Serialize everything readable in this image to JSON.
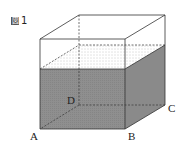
{
  "figure": {
    "label_glyph": "図",
    "label_number": "1",
    "vertices": {
      "A": "A",
      "B": "B",
      "C": "C",
      "D": "D"
    },
    "colors": {
      "water": "#8f8f8f",
      "water_side": "#7a7a7a",
      "edge": "#333333",
      "surface_dots": "#888888"
    }
  }
}
